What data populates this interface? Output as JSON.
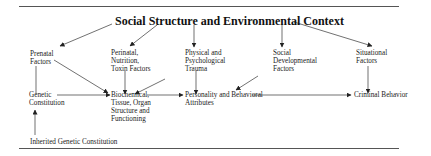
{
  "title": "Social Structure and Environmental Context",
  "nodes": {
    "prenatal": "Prenatal\nFactors",
    "perinatal": "Perinatal,\nNutrition,\nToxin Factors",
    "trauma": "Physical and\nPsychological\nTrauma",
    "social_dev": "Social\nDevelopmental\nFactors",
    "situational": "Situational\nFactors",
    "genetic": "Genetic\nConstitution",
    "biochemical": "Biochemical,\nTissue, Organ\nStructure and\nFunctioning",
    "personality": "Personality and Behavioral\nAttributes",
    "criminal": "Criminal Behavior",
    "inherited": "Inherited Genetic Constitution"
  },
  "edges": [
    {
      "from": "Social Structure and Environmental Context",
      "to": "Prenatal Factors"
    },
    {
      "from": "Social Structure and Environmental Context",
      "to": "Perinatal, Nutrition, Toxin Factors"
    },
    {
      "from": "Social Structure and Environmental Context",
      "to": "Physical and Psychological Trauma"
    },
    {
      "from": "Social Structure and Environmental Context",
      "to": "Social Developmental Factors"
    },
    {
      "from": "Social Structure and Environmental Context",
      "to": "Situational Factors"
    },
    {
      "from": "Prenatal Factors",
      "to": "Genetic Constitution"
    },
    {
      "from": "Prenatal Factors",
      "to": "Biochemical, Tissue, Organ Structure and Functioning"
    },
    {
      "from": "Perinatal, Nutrition, Toxin Factors",
      "to": "Biochemical, Tissue, Organ Structure and Functioning"
    },
    {
      "from": "Physical and Psychological Trauma",
      "to": "Biochemical, Tissue, Organ Structure and Functioning"
    },
    {
      "from": "Physical and Psychological Trauma",
      "to": "Personality and Behavioral Attributes"
    },
    {
      "from": "Social Developmental Factors",
      "to": "Personality and Behavioral Attributes"
    },
    {
      "from": "Situational Factors",
      "to": "Criminal Behavior"
    },
    {
      "from": "Genetic Constitution",
      "to": "Biochemical, Tissue, Organ Structure and Functioning"
    },
    {
      "from": "Biochemical, Tissue, Organ Structure and Functioning",
      "to": "Personality and Behavioral Attributes"
    },
    {
      "from": "Personality and Behavioral Attributes",
      "to": "Criminal Behavior"
    },
    {
      "from": "Inherited Genetic Constitution",
      "to": "Genetic Constitution"
    }
  ]
}
